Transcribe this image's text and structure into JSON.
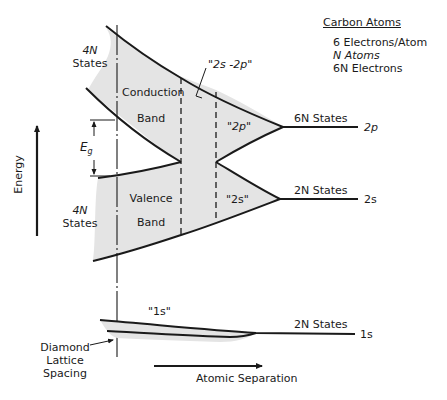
{
  "diagram": {
    "legend": {
      "title": "Carbon Atoms",
      "lines": [
        "6 Electrons/Atom",
        "N Atoms",
        "6N Electrons"
      ]
    },
    "axes": {
      "energy_label": "Energy",
      "separation_label": "Atomic Separation"
    },
    "bands": {
      "conduction": {
        "line1": "Conduction",
        "line2": "Band"
      },
      "valence": {
        "line1": "Valence",
        "line2": "Band"
      },
      "upper_states_left": {
        "line1": "4N",
        "line2": "States"
      },
      "lower_states_left": {
        "line1": "4N",
        "line2": "States"
      }
    },
    "regions": {
      "hybrid": "\"2s -2p\"",
      "p_region": "\"2p\"",
      "s_region": "\"2s\"",
      "one_s": "\"1s\""
    },
    "levels": [
      {
        "id": "2p",
        "states": "6N States",
        "label": "2p"
      },
      {
        "id": "2s",
        "states": "2N States",
        "label": "2s"
      },
      {
        "id": "1s",
        "states": "2N States",
        "label": "1s"
      }
    ],
    "gap_label": "Eg",
    "lattice_label": {
      "line1": "Diamond",
      "line2": "Lattice",
      "line3": "Spacing"
    },
    "colors": {
      "line": "#1a1a1a",
      "shade": "#e4e4e4",
      "background": "#ffffff"
    }
  }
}
